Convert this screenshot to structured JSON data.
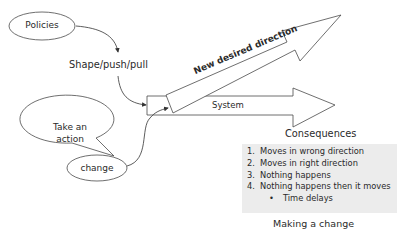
{
  "diagram": {
    "title": "Making a change",
    "nodes": {
      "policies": "Policies",
      "shape": "Shape/push/pull",
      "take_action_line1": "Take an",
      "take_action_line2": "action",
      "change": "change"
    },
    "arrows": {
      "system": "System",
      "new_direction": "New desired direction"
    },
    "consequences": {
      "heading": "Consequences",
      "items": [
        {
          "num": "1.",
          "text": "Moves in wrong direction"
        },
        {
          "num": "2.",
          "text": "Moves in right direction"
        },
        {
          "num": "3.",
          "text": "Nothing happens"
        },
        {
          "num": "4.",
          "text": "Nothing happens then it moves"
        }
      ],
      "sub_items": [
        {
          "bullet": "•",
          "text": "Time delays"
        }
      ]
    },
    "colors": {
      "stroke": "#4a4a4a",
      "box_fill": "#ececec",
      "background": "#ffffff"
    }
  }
}
